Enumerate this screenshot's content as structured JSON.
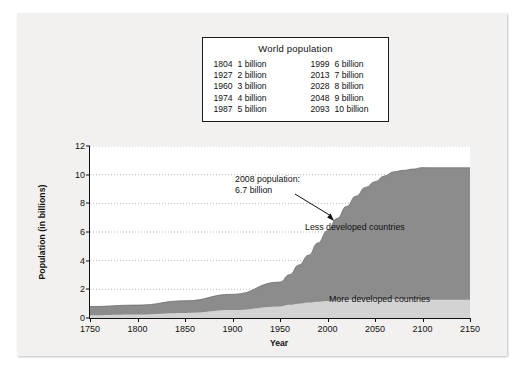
{
  "fact_box": {
    "title": "World population",
    "rows": [
      {
        "year_left": "1804",
        "value_left": "1 billion",
        "year_right": "1999",
        "value_right": "6 billion"
      },
      {
        "year_left": "1927",
        "value_left": "2 billion",
        "year_right": "2013",
        "value_right": "7 billion"
      },
      {
        "year_left": "1960",
        "value_left": "3 billion",
        "year_right": "2028",
        "value_right": "8 billion"
      },
      {
        "year_left": "1974",
        "value_left": "4 billion",
        "year_right": "2048",
        "value_right": "9 billion"
      },
      {
        "year_left": "1987",
        "value_left": "5 billion",
        "year_right": "2093",
        "value_right": "10 billion"
      }
    ]
  },
  "annotations": {
    "population_callout": "2008 population:\n6.7 billion",
    "population_callout_line1": "2008 population:",
    "population_callout_line2": "6.7 billion",
    "less_developed": "Less developed countries",
    "more_developed": "More developed countries"
  },
  "colors": {
    "less_developed": "#8c8c8c",
    "more_developed": "#d3d3d3",
    "background": "#f2f1ef",
    "plot_background": "#ffffff",
    "axis": "#111111"
  },
  "chart_data": {
    "type": "area",
    "title": "",
    "subtitle": "",
    "xlabel": "Year",
    "ylabel": "Population (in billions)",
    "xlim": [
      1750,
      2150
    ],
    "ylim": [
      0,
      12
    ],
    "xticks": [
      1750,
      1800,
      1850,
      1900,
      1950,
      2000,
      2050,
      2100,
      2150
    ],
    "yticks": [
      0,
      2,
      4,
      6,
      8,
      10,
      12
    ],
    "grid": "horizontal-dotted",
    "legend": "inline-labels",
    "stacked": true,
    "x": [
      1750,
      1800,
      1850,
      1900,
      1950,
      1960,
      1970,
      1980,
      1990,
      2000,
      2010,
      2020,
      2030,
      2040,
      2050,
      2060,
      2070,
      2080,
      2090,
      2100,
      2110,
      2120,
      2130,
      2140,
      2150
    ],
    "series": [
      {
        "name": "More developed countries",
        "values": [
          0.2,
          0.25,
          0.35,
          0.55,
          0.81,
          0.92,
          1.0,
          1.08,
          1.14,
          1.19,
          1.24,
          1.28,
          1.3,
          1.31,
          1.31,
          1.31,
          1.3,
          1.3,
          1.29,
          1.29,
          1.28,
          1.28,
          1.28,
          1.28,
          1.28
        ]
      },
      {
        "name": "Less developed countries",
        "values": [
          0.6,
          0.65,
          0.85,
          1.1,
          1.7,
          2.1,
          2.7,
          3.3,
          4.1,
          4.9,
          5.7,
          6.5,
          7.2,
          7.8,
          8.2,
          8.6,
          8.9,
          9.0,
          9.1,
          9.2,
          9.2,
          9.2,
          9.2,
          9.2,
          9.2
        ]
      }
    ],
    "totals": [
      0.8,
      0.9,
      1.2,
      1.65,
      2.51,
      3.02,
      3.7,
      4.38,
      5.24,
      6.09,
      6.94,
      7.78,
      8.5,
      9.11,
      9.51,
      9.91,
      10.2,
      10.3,
      10.39,
      10.49,
      10.48,
      10.48,
      10.48,
      10.48,
      10.48
    ],
    "annotation_point": {
      "x": 2008,
      "y": 6.7,
      "label": "2008 population: 6.7 billion"
    }
  }
}
